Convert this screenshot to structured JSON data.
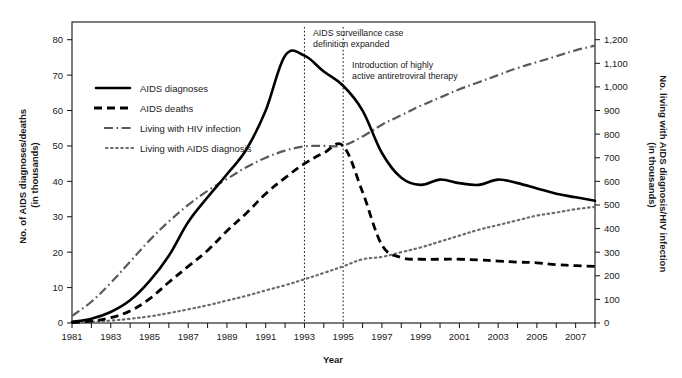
{
  "chart_data": {
    "type": "line",
    "title": "",
    "xlabel": "Year",
    "ylabel": "No. of AIDS diagnoses/deaths (in thousands)",
    "ylabel_right": "No. living with AIDS diagnosis/HIV infection (in thousands)",
    "xlim": [
      1981,
      2008
    ],
    "ylim": [
      0,
      85
    ],
    "ylim_right": [
      0,
      1275
    ],
    "grid": false,
    "legend_position": "upper-left-inside",
    "x": [
      1981,
      1982,
      1983,
      1984,
      1985,
      1986,
      1987,
      1988,
      1989,
      1990,
      1991,
      1992,
      1993,
      1994,
      1995,
      1996,
      1997,
      1998,
      1999,
      2000,
      2001,
      2002,
      2003,
      2004,
      2005,
      2006,
      2007,
      2008
    ],
    "xticks": [
      "1981",
      "1983",
      "1985",
      "1987",
      "1989",
      "1991",
      "1993",
      "1995",
      "1997",
      "1999",
      "2001",
      "2003",
      "2005",
      "2007"
    ],
    "yticks": [
      "0",
      "10",
      "20",
      "30",
      "40",
      "50",
      "60",
      "70",
      "80"
    ],
    "yticks_right": [
      "0",
      "100",
      "200",
      "300",
      "400",
      "500",
      "600",
      "700",
      "800",
      "900",
      "1,000",
      "1,100",
      "1,200"
    ],
    "series": [
      {
        "name": "AIDS diagnoses",
        "axis": "left",
        "style": "solid",
        "color": "#000000",
        "values": [
          0.3,
          1.2,
          3.1,
          6.4,
          11.8,
          19.0,
          28.5,
          35.5,
          42.0,
          49.0,
          60.0,
          75.5,
          75.5,
          71.0,
          67.0,
          60.0,
          48.0,
          41.0,
          39.0,
          40.5,
          39.5,
          39.0,
          40.5,
          39.5,
          38.0,
          36.5,
          35.5,
          34.5
        ]
      },
      {
        "name": "AIDS deaths",
        "axis": "left",
        "style": "dashed",
        "color": "#000000",
        "values": [
          0.1,
          0.5,
          1.5,
          3.4,
          6.8,
          11.5,
          16.0,
          20.5,
          26.0,
          31.0,
          36.5,
          41.0,
          45.0,
          48.0,
          50.0,
          37.0,
          22.0,
          18.5,
          18.0,
          18.0,
          18.0,
          17.8,
          17.5,
          17.2,
          17.0,
          16.5,
          16.2,
          16.0
        ]
      },
      {
        "name": "Living with HIV infection",
        "axis": "right",
        "style": "dash-dot",
        "color": "#5a5a5a",
        "values": [
          30,
          90,
          170,
          260,
          350,
          430,
          500,
          560,
          610,
          660,
          700,
          730,
          748,
          750,
          752,
          790,
          840,
          880,
          920,
          955,
          990,
          1020,
          1050,
          1080,
          1105,
          1130,
          1155,
          1175
        ]
      },
      {
        "name": "Living with AIDS diagnosis",
        "axis": "right",
        "style": "dotted",
        "color": "#6a6a6a",
        "values": [
          2,
          5,
          10,
          18,
          28,
          42,
          58,
          75,
          95,
          115,
          138,
          160,
          185,
          212,
          240,
          270,
          280,
          300,
          320,
          345,
          370,
          395,
          415,
          435,
          455,
          468,
          482,
          492
        ]
      }
    ],
    "annotations": [
      {
        "name": "aids-surveillance-case-definition",
        "year": 1993,
        "line1": "AIDS surveillance case",
        "line2": "definition expanded"
      },
      {
        "name": "haart-introduction",
        "year": 1995,
        "line1": "Introduction of highly",
        "line2": "active antiretroviral therapy"
      }
    ]
  }
}
